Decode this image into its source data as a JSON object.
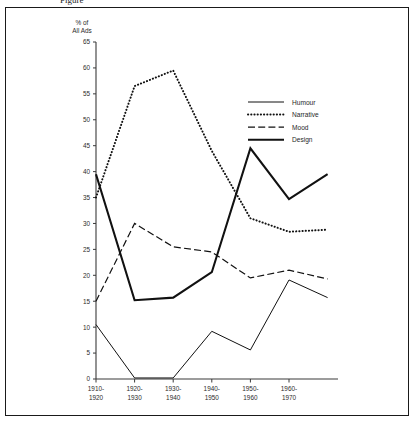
{
  "figure": {
    "cropped_header_text": "Figure",
    "y_axis_caption_line1": "% of",
    "y_axis_caption_line2": "All Ads"
  },
  "chart_data": {
    "type": "line",
    "title": "",
    "xlabel": "",
    "ylabel": "% of All Ads",
    "categories": [
      "1910-\n1920",
      "1920-\n1930",
      "1930-\n1940",
      "1940-\n1950",
      "1950-\n1960",
      "1960-\n1970",
      ""
    ],
    "x_tick_labels": [
      {
        "top": "1910-",
        "bottom": "1920"
      },
      {
        "top": "1920-",
        "bottom": "1930"
      },
      {
        "top": "1930-",
        "bottom": "1940"
      },
      {
        "top": "1940-",
        "bottom": "1950"
      },
      {
        "top": "1950-",
        "bottom": "1960"
      },
      {
        "top": "1960-",
        "bottom": "1970"
      }
    ],
    "y_tick_labels": [
      "0",
      "5",
      "10",
      "15",
      "20",
      "25",
      "30",
      "35",
      "40",
      "45",
      "50",
      "55",
      "60",
      "65"
    ],
    "ylim": [
      0,
      65
    ],
    "ytick_step": 5,
    "grid": false,
    "legend_position": "upper right",
    "series": [
      {
        "name": "Humour",
        "style": "solid-thin",
        "values": [
          10.5,
          0.2,
          0.2,
          9.2,
          5.6,
          19.1,
          15.7
        ]
      },
      {
        "name": "Narrative",
        "style": "dotted",
        "values": [
          35.0,
          56.5,
          59.5,
          44.0,
          31.0,
          28.4,
          28.8
        ]
      },
      {
        "name": "Mood",
        "style": "dashed",
        "values": [
          15.0,
          30.0,
          25.5,
          24.5,
          19.5,
          21.0,
          19.3
        ]
      },
      {
        "name": "Design",
        "style": "solid-thick",
        "values": [
          39.5,
          15.2,
          15.7,
          20.6,
          44.5,
          34.7,
          39.5
        ]
      }
    ]
  },
  "legend": {
    "items": [
      {
        "label": "Humour",
        "style": "solid-thin"
      },
      {
        "label": "Narrative",
        "style": "dotted"
      },
      {
        "label": "Mood",
        "style": "dashed"
      },
      {
        "label": "Design",
        "style": "solid-thick"
      }
    ]
  }
}
